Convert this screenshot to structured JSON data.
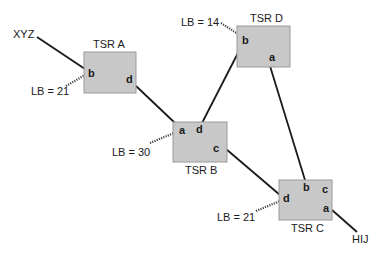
{
  "nodes": {
    "tsr_a": {
      "title": "TSR A",
      "ports": {
        "b": "b",
        "d": "d"
      }
    },
    "tsr_b": {
      "title": "TSR B",
      "ports": {
        "a": "a",
        "d": "d",
        "c": "c"
      }
    },
    "tsr_c": {
      "title": "TSR C",
      "ports": {
        "b": "b",
        "c": "c",
        "d": "d",
        "a": "a"
      }
    },
    "tsr_d": {
      "title": "TSR D",
      "ports": {
        "b": "b",
        "a": "a"
      }
    }
  },
  "endpoints": {
    "ingress": "XYZ",
    "egress": "HIJ"
  },
  "labels": {
    "tsr_a_b": "LB = 21",
    "tsr_d_b": "LB = 14",
    "tsr_b_a": "LB = 30",
    "tsr_c_d": "LB = 21"
  },
  "links": [
    {
      "from": "XYZ",
      "to": "TSR A.b"
    },
    {
      "from": "TSR A.d",
      "to": "TSR B.a"
    },
    {
      "from": "TSR B.d",
      "to": "TSR D.b"
    },
    {
      "from": "TSR D.a",
      "to": "TSR C.b"
    },
    {
      "from": "TSR B.c",
      "to": "TSR C.d"
    },
    {
      "from": "TSR C.a",
      "to": "HIJ"
    }
  ],
  "colors": {
    "box_fill": "#c8c8c8",
    "line": "#1a1a1a"
  }
}
